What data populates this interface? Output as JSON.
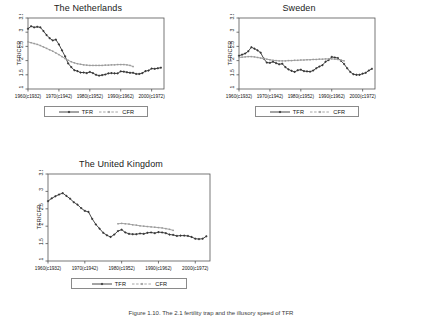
{
  "figure": {
    "caption": "Figure 1.10. The 2.1 fertility trap and the illusory speed of TFR",
    "ylabel": "TFR/CFR",
    "legend": {
      "tfr": "TFR",
      "cfr": "CFR"
    },
    "colors": {
      "tfr": "#333333",
      "cfr": "#9a9a9a",
      "axis": "#555555",
      "text": "#111111"
    }
  },
  "chart_data": [
    {
      "type": "line",
      "title": "The Netherlands",
      "xlabel": "",
      "ylabel": "TFR/CFR",
      "ylim": [
        1,
        3.5
      ],
      "yticks": [
        1,
        1.5,
        2,
        2.5,
        3,
        3.5
      ],
      "ytick_labels": [
        "1",
        "1.5",
        "2",
        "2.5",
        "3",
        "3.5"
      ],
      "xlim": [
        1960,
        2004
      ],
      "xticks": [
        1960,
        1970,
        1980,
        1990,
        2000
      ],
      "xtick_labels": [
        "1960(c1932)",
        "1970(c1942)",
        "1980(c1952)",
        "1990(c1962)",
        "2000(c1972)"
      ],
      "grid": false,
      "legend_position": "below",
      "series": [
        {
          "name": "TFR",
          "x": [
            1960,
            1961,
            1962,
            1963,
            1964,
            1965,
            1966,
            1967,
            1968,
            1969,
            1970,
            1971,
            1972,
            1973,
            1974,
            1975,
            1976,
            1977,
            1978,
            1979,
            1980,
            1981,
            1982,
            1983,
            1984,
            1985,
            1986,
            1987,
            1988,
            1989,
            1990,
            1991,
            1992,
            1993,
            1994,
            1995,
            1996,
            1997,
            1998,
            1999,
            2000,
            2001,
            2002,
            2003
          ],
          "values": [
            3.12,
            3.21,
            3.17,
            3.19,
            3.17,
            3.04,
            2.9,
            2.79,
            2.71,
            2.74,
            2.57,
            2.36,
            2.15,
            1.9,
            1.77,
            1.66,
            1.63,
            1.58,
            1.58,
            1.56,
            1.6,
            1.56,
            1.5,
            1.47,
            1.49,
            1.51,
            1.55,
            1.56,
            1.55,
            1.55,
            1.62,
            1.61,
            1.59,
            1.57,
            1.57,
            1.53,
            1.53,
            1.56,
            1.63,
            1.65,
            1.72,
            1.71,
            1.73,
            1.75
          ]
        },
        {
          "name": "CFR",
          "x": [
            1960,
            1961,
            1962,
            1963,
            1964,
            1965,
            1966,
            1967,
            1968,
            1969,
            1970,
            1971,
            1972,
            1973,
            1974,
            1975,
            1976,
            1977,
            1978,
            1979,
            1980,
            1981,
            1982,
            1983,
            1984,
            1985,
            1986,
            1987,
            1988,
            1989,
            1990,
            1991,
            1992,
            1993,
            1994
          ],
          "values": [
            2.66,
            2.63,
            2.6,
            2.57,
            2.53,
            2.48,
            2.43,
            2.38,
            2.33,
            2.27,
            2.21,
            2.14,
            2.07,
            2.01,
            1.96,
            1.92,
            1.89,
            1.87,
            1.85,
            1.84,
            1.83,
            1.83,
            1.83,
            1.83,
            1.83,
            1.84,
            1.84,
            1.85,
            1.85,
            1.86,
            1.86,
            1.86,
            1.85,
            1.83,
            1.79
          ]
        }
      ]
    },
    {
      "type": "line",
      "title": "Sweden",
      "xlabel": "",
      "ylabel": "TFR/CFR",
      "ylim": [
        1,
        3.5
      ],
      "yticks": [
        1,
        1.5,
        2,
        2.5,
        3,
        3.5
      ],
      "ytick_labels": [
        "1",
        "1.5",
        "2",
        "2.5",
        "3",
        "3.5"
      ],
      "xlim": [
        1960,
        2004
      ],
      "xticks": [
        1960,
        1970,
        1980,
        1990,
        2000
      ],
      "xtick_labels": [
        "1960(c1932)",
        "1970(c1942)",
        "1980(c1952)",
        "1990(c1962)",
        "2000(c1972)"
      ],
      "grid": false,
      "legend_position": "below",
      "series": [
        {
          "name": "TFR",
          "x": [
            1960,
            1961,
            1962,
            1963,
            1964,
            1965,
            1966,
            1967,
            1968,
            1969,
            1970,
            1971,
            1972,
            1973,
            1974,
            1975,
            1976,
            1977,
            1978,
            1979,
            1980,
            1981,
            1982,
            1983,
            1984,
            1985,
            1986,
            1987,
            1988,
            1989,
            1990,
            1991,
            1992,
            1993,
            1994,
            1995,
            1996,
            1997,
            1998,
            1999,
            2000,
            2001,
            2002,
            2003
          ],
          "values": [
            2.17,
            2.21,
            2.25,
            2.33,
            2.47,
            2.42,
            2.36,
            2.28,
            2.07,
            1.93,
            1.92,
            1.96,
            1.91,
            1.87,
            1.89,
            1.77,
            1.69,
            1.64,
            1.6,
            1.66,
            1.68,
            1.63,
            1.62,
            1.61,
            1.65,
            1.73,
            1.79,
            1.84,
            1.96,
            2.02,
            2.13,
            2.11,
            2.09,
            1.99,
            1.88,
            1.73,
            1.6,
            1.52,
            1.5,
            1.5,
            1.54,
            1.57,
            1.65,
            1.71
          ]
        },
        {
          "name": "CFR",
          "x": [
            1960,
            1961,
            1962,
            1963,
            1964,
            1965,
            1966,
            1967,
            1968,
            1969,
            1970,
            1971,
            1972,
            1973,
            1974,
            1975,
            1976,
            1977,
            1978,
            1979,
            1980,
            1981,
            1982,
            1983,
            1984,
            1985,
            1986,
            1987,
            1988,
            1989,
            1990,
            1991,
            1992,
            1993,
            1994
          ],
          "values": [
            2.11,
            2.12,
            2.13,
            2.14,
            2.14,
            2.13,
            2.11,
            2.09,
            2.07,
            2.05,
            2.03,
            2.01,
            2.0,
            1.99,
            1.99,
            1.99,
            2.0,
            2.0,
            2.01,
            2.01,
            2.02,
            2.02,
            2.03,
            2.03,
            2.04,
            2.04,
            2.05,
            2.05,
            2.06,
            2.06,
            2.06,
            2.05,
            2.04,
            2.02,
            1.99
          ]
        }
      ]
    },
    {
      "type": "line",
      "title": "The United Kingdom",
      "xlabel": "",
      "ylabel": "TFR/CFR",
      "ylim": [
        1,
        3.5
      ],
      "yticks": [
        1,
        1.5,
        2,
        2.5,
        3,
        3.5
      ],
      "ytick_labels": [
        "1",
        "1.5",
        "2",
        "2.5",
        "3",
        "3.5"
      ],
      "xlim": [
        1960,
        2004
      ],
      "xticks": [
        1960,
        1970,
        1980,
        1990,
        2000
      ],
      "xtick_labels": [
        "1960(c1932)",
        "1970(c1942)",
        "1980(c1952)",
        "1990(c1962)",
        "2000(c1972)"
      ],
      "grid": false,
      "legend_position": "below",
      "series": [
        {
          "name": "TFR",
          "x": [
            1960,
            1961,
            1962,
            1963,
            1964,
            1965,
            1966,
            1967,
            1968,
            1969,
            1970,
            1971,
            1972,
            1973,
            1974,
            1975,
            1976,
            1977,
            1978,
            1979,
            1980,
            1981,
            1982,
            1983,
            1984,
            1985,
            1986,
            1987,
            1988,
            1989,
            1990,
            1991,
            1992,
            1993,
            1994,
            1995,
            1996,
            1997,
            1998,
            1999,
            2000,
            2001,
            2002,
            2003
          ],
          "values": [
            2.72,
            2.8,
            2.86,
            2.91,
            2.95,
            2.87,
            2.79,
            2.69,
            2.62,
            2.52,
            2.44,
            2.41,
            2.21,
            2.05,
            1.93,
            1.81,
            1.74,
            1.69,
            1.76,
            1.86,
            1.9,
            1.82,
            1.78,
            1.77,
            1.77,
            1.79,
            1.78,
            1.81,
            1.82,
            1.8,
            1.83,
            1.82,
            1.8,
            1.76,
            1.75,
            1.72,
            1.73,
            1.73,
            1.72,
            1.69,
            1.64,
            1.63,
            1.64,
            1.71
          ]
        },
        {
          "name": "CFR",
          "x": [
            1979,
            1980,
            1981,
            1982,
            1983,
            1984,
            1985,
            1986,
            1987,
            1988,
            1989,
            1990,
            1991,
            1992,
            1993,
            1994
          ],
          "values": [
            2.07,
            2.08,
            2.07,
            2.06,
            2.04,
            2.03,
            2.01,
            2.0,
            1.99,
            1.98,
            1.97,
            1.96,
            1.95,
            1.93,
            1.91,
            1.88
          ]
        }
      ]
    }
  ]
}
